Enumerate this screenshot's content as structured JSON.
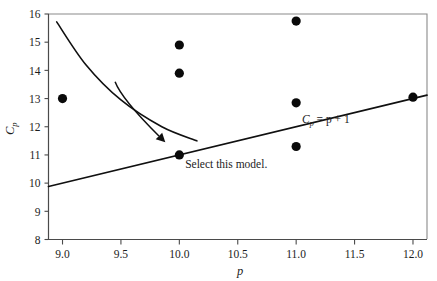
{
  "chart_data": {
    "type": "scatter",
    "title": "",
    "subtitle": "",
    "xlabel": "p",
    "ylabel": "Cp",
    "ylabel_base": "C",
    "ylabel_sub": "p",
    "xlim": [
      8.88,
      12.12
    ],
    "ylim": [
      8,
      16
    ],
    "grid": false,
    "legend_position": "none",
    "xticks": [
      9.0,
      9.5,
      10.0,
      10.5,
      11.0,
      11.5,
      12.0
    ],
    "xtick_labels": [
      "9.0",
      "9.5",
      "10.0",
      "10.5",
      "11.0",
      "11.5",
      "12.0"
    ],
    "yticks": [
      8,
      9,
      10,
      11,
      12,
      13,
      14,
      15,
      16
    ],
    "ytick_labels": [
      "8",
      "9",
      "10",
      "11",
      "12",
      "13",
      "14",
      "15",
      "16"
    ],
    "points": [
      {
        "x": 9.0,
        "y": 13.0
      },
      {
        "x": 10.0,
        "y": 14.9
      },
      {
        "x": 10.0,
        "y": 13.9
      },
      {
        "x": 10.0,
        "y": 11.0
      },
      {
        "x": 11.0,
        "y": 15.75
      },
      {
        "x": 11.0,
        "y": 12.85
      },
      {
        "x": 11.0,
        "y": 11.3
      },
      {
        "x": 12.0,
        "y": 13.05
      }
    ],
    "series": [
      {
        "name": "Cp = p + 1",
        "type": "line",
        "label": "Cp = p + 1",
        "label_parts": {
          "base": "C",
          "sub": "p",
          "rest": " = p + 1"
        },
        "x": [
          8.88,
          12.12
        ],
        "values": [
          9.88,
          13.12
        ],
        "label_x": 11.05,
        "label_y": 12.15
      },
      {
        "name": "reference-curve",
        "type": "curve",
        "x": [
          8.95,
          9.2,
          9.5,
          9.85,
          10.15
        ],
        "values": [
          15.72,
          14.2,
          12.95,
          12.0,
          11.5
        ]
      }
    ],
    "annotations": [
      {
        "name": "select-this-model",
        "text": "Select this model.",
        "text_x": 10.05,
        "text_y": 10.52,
        "arrow_from": {
          "x": 9.45,
          "y": 13.6
        },
        "arrow_to": {
          "x": 9.88,
          "y": 11.45
        }
      }
    ]
  },
  "figure": {
    "frame_color": "#8a8a8a",
    "point_color": "#0a0a0a",
    "line_color": "#101010",
    "text_color": "#1c1c1c"
  }
}
